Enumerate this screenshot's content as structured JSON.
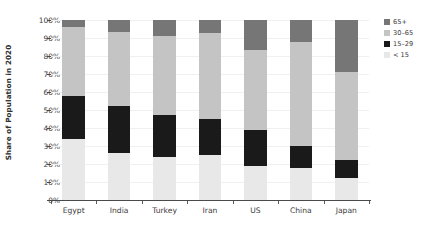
{
  "chart_data": {
    "type": "bar",
    "subtype": "stacked-bar-100-percent",
    "title": "",
    "xlabel": "",
    "ylabel": "Share of Population in 2020",
    "ylim": [
      0,
      100
    ],
    "ytick_labels": [
      "0%",
      "10%",
      "20%",
      "30%",
      "40%",
      "50%",
      "60%",
      "70%",
      "80%",
      "90%",
      "100%"
    ],
    "ytick_values": [
      0,
      10,
      20,
      30,
      40,
      50,
      60,
      70,
      80,
      90,
      100
    ],
    "grid": true,
    "legend_position": "right",
    "stack_order_bottom_to_top": [
      "< 15",
      "15-29",
      "30-65",
      "65+"
    ],
    "categories": [
      "Egypt",
      "India",
      "Turkey",
      "Iran",
      "US",
      "China",
      "Japan"
    ],
    "series": [
      {
        "name": "< 15",
        "color": "#e8e8e8",
        "values": [
          34.0,
          26.0,
          24.0,
          25.0,
          19.0,
          18.0,
          12.0
        ]
      },
      {
        "name": "15-29",
        "color": "#1a1a1a",
        "values": [
          24.0,
          26.0,
          23.0,
          20.0,
          20.0,
          12.0,
          10.0
        ]
      },
      {
        "name": "30-65",
        "color": "#c4c4c4",
        "values": [
          38.0,
          41.5,
          44.0,
          48.0,
          44.5,
          58.0,
          49.0
        ]
      },
      {
        "name": "65+",
        "color": "#767676",
        "values": [
          4.0,
          6.5,
          9.0,
          7.0,
          16.5,
          12.0,
          29.0
        ]
      }
    ]
  },
  "legend": {
    "entries": [
      {
        "label": "65+",
        "color": "#767676"
      },
      {
        "label": "30–65",
        "color": "#c4c4c4"
      },
      {
        "label": "15–29",
        "color": "#1a1a1a"
      },
      {
        "label": "< 15",
        "color": "#e8e8e8"
      }
    ]
  },
  "axes": {
    "y_title": "Share of Population in 2020"
  }
}
